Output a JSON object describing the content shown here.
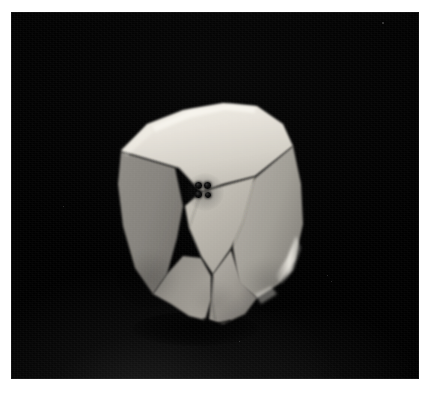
{
  "image": {
    "kind": "photograph",
    "subject": "flaked stone artifact (lithic core)",
    "caption": "",
    "background_description": "plain black photographic backdrop with a faint grey wash toward the lower area",
    "border": {
      "style": "white photographic print margin",
      "color": "#ffffff",
      "left_px": 11,
      "top_px": 12,
      "right_px": 11,
      "bottom_px": 16
    },
    "plate": {
      "color_top": "#000000",
      "color_bottom": "#121212",
      "width_px": 408,
      "height_px": 367
    }
  },
  "artifact": {
    "label": "",
    "position_px": {
      "left": 105,
      "top": 88,
      "width": 200,
      "height": 235
    },
    "material_tone": "#cfcac2",
    "facets": [
      {
        "name": "upper-platform-facet",
        "tone": "#e8e4dc",
        "note": "bright flat striking platform across the top"
      },
      {
        "name": "upper-left-ridge-facet",
        "tone": "#c2bdb4",
        "note": "narrow lit sliver along the upper-left arris"
      },
      {
        "name": "left-flake-scar",
        "tone": "#8d8a84",
        "note": "large shadowed scar down the left flank"
      },
      {
        "name": "central-triangular-facet",
        "tone": "#b9b5ad",
        "note": "downward-pointing triangular scar bearing the ink marks"
      },
      {
        "name": "right-flake-scar",
        "tone": "#a5a29b",
        "note": "broad scar on the right flank"
      },
      {
        "name": "lower-tip-facet",
        "tone": "#9c998f",
        "note": "converging facets tapering to the basal tip"
      }
    ],
    "highlights": [
      {
        "name": "right-edge-highlight",
        "tone": "#f2efe8"
      },
      {
        "name": "top-ridge-highlight",
        "tone": "#f6f3ec"
      }
    ]
  },
  "ink_marks": {
    "name": "four-dot-ink-mark",
    "count": 4,
    "arrangement": "2 x 2 square",
    "color": "#000000",
    "center_px": {
      "x": 208,
      "y": 192
    },
    "dot_diameter_px": 7,
    "description": "four small black ink dots marking a point on the central facet"
  },
  "shadow": {
    "name": "cast-shadow",
    "color": "#000000",
    "description": "dark cast shadow beneath the basal tip of the artifact"
  },
  "specks": [
    {
      "x": 382,
      "y": 22,
      "size": 1.6
    },
    {
      "x": 327,
      "y": 275,
      "size": 1.4
    },
    {
      "x": 331,
      "y": 281,
      "size": 1.1
    },
    {
      "x": 63,
      "y": 206,
      "size": 1.2
    },
    {
      "x": 239,
      "y": 341,
      "size": 1.3
    }
  ]
}
